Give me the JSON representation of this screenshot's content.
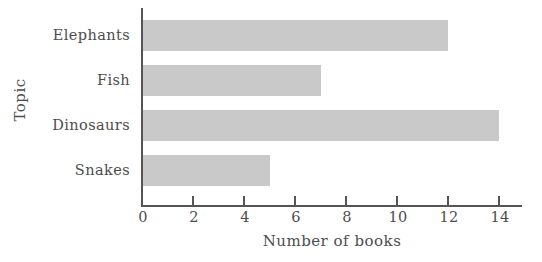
{
  "chart_data": {
    "type": "bar",
    "orientation": "horizontal",
    "title": "",
    "xlabel": "Number of books",
    "ylabel": "Topic",
    "categories": [
      "Elephants",
      "Fish",
      "Dinosaurs",
      "Snakes"
    ],
    "values": [
      12,
      7,
      14,
      5
    ],
    "series": [
      {
        "name": "Number of books",
        "values": [
          12,
          7,
          14,
          5
        ]
      }
    ],
    "xlim": [
      0,
      14.9
    ],
    "xticks": [
      0,
      2,
      4,
      6,
      8,
      10,
      12,
      14
    ],
    "xtick_labels": [
      "0",
      "2",
      "4",
      "6",
      "8",
      "10",
      "12",
      "14"
    ],
    "grid": false,
    "legend": false,
    "legend_position": "none",
    "colors": {
      "bar": "#c9c9c9",
      "axis": "#555555",
      "text": "#4d4d4d",
      "background": "#ffffff"
    }
  }
}
